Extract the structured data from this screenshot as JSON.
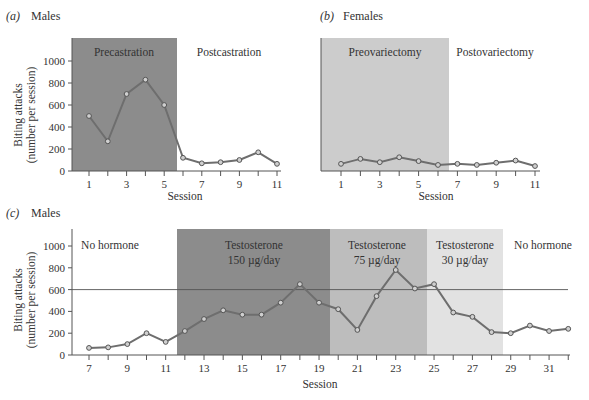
{
  "chart_data": [
    {
      "type": "line",
      "panel": "(a)",
      "title": "Males",
      "xlabel": "Session",
      "ylabel": "Biting attacks (number per session)",
      "ylim": [
        0,
        1100
      ],
      "yticks": [
        0,
        200,
        400,
        600,
        800,
        1000
      ],
      "xticks_labeled": [
        1,
        3,
        5,
        7,
        9,
        11
      ],
      "x": [
        1,
        2,
        3,
        4,
        5,
        6,
        7,
        8,
        9,
        10,
        11
      ],
      "values": [
        500,
        270,
        700,
        830,
        600,
        120,
        70,
        80,
        100,
        170,
        65
      ],
      "regions": [
        {
          "label": "Precastration",
          "from": 0.2,
          "to": 5.6,
          "shade": "#8c8c8c"
        },
        {
          "label": "Postcastration",
          "from": 5.6,
          "to": 11,
          "shade": "#ffffff"
        }
      ],
      "grid": false
    },
    {
      "type": "line",
      "panel": "(b)",
      "title": "Females",
      "xlabel": "Session",
      "ylabel": "",
      "ylim": [
        0,
        1100
      ],
      "xticks_labeled": [
        1,
        3,
        5,
        7,
        9,
        11
      ],
      "x": [
        1,
        2,
        3,
        4,
        5,
        6,
        7,
        8,
        9,
        10,
        11
      ],
      "values": [
        65,
        110,
        80,
        125,
        90,
        55,
        65,
        55,
        75,
        95,
        45
      ],
      "regions": [
        {
          "label": "Preovariectomy",
          "from": 0,
          "to": 6.5,
          "shade": "#cccccc"
        },
        {
          "label": "Postovariectomy",
          "from": 6.5,
          "to": 11,
          "shade": "#ffffff"
        }
      ],
      "grid": false
    },
    {
      "type": "line",
      "panel": "(c)",
      "title": "Males",
      "xlabel": "Session",
      "ylabel": "Biting attacks (number per session)",
      "ylim": [
        0,
        1100
      ],
      "yticks": [
        0,
        200,
        400,
        600,
        800,
        1000
      ],
      "xticks_labeled": [
        7,
        9,
        11,
        13,
        15,
        17,
        19,
        21,
        23,
        25,
        27,
        29,
        31
      ],
      "x": [
        7,
        8,
        9,
        10,
        11,
        12,
        13,
        14,
        15,
        16,
        17,
        18,
        19,
        20,
        21,
        22,
        23,
        24,
        25,
        26,
        27,
        28,
        29,
        30,
        31,
        32
      ],
      "values": [
        65,
        70,
        100,
        200,
        120,
        220,
        330,
        410,
        370,
        370,
        480,
        650,
        480,
        420,
        230,
        540,
        780,
        610,
        650,
        390,
        350,
        210,
        200,
        270,
        220,
        240
      ],
      "reference_line": 600,
      "regions": [
        {
          "label": "No hormone",
          "sub": "",
          "from": 6.1,
          "to": 11.6,
          "shade": "#ffffff"
        },
        {
          "label": "Testosterone",
          "sub": "150 µg/day",
          "from": 11.6,
          "to": 19.5,
          "shade": "#8c8c8c"
        },
        {
          "label": "Testosterone",
          "sub": "75 µg/day",
          "from": 19.5,
          "to": 24.5,
          "shade": "#bdbdbd"
        },
        {
          "label": "Testosterone",
          "sub": "30 µg/day",
          "from": 24.5,
          "to": 28.6,
          "shade": "#e2e2e2"
        },
        {
          "label": "No hormone",
          "sub": "",
          "from": 28.6,
          "to": 32,
          "shade": "#ffffff"
        }
      ],
      "grid": false
    }
  ],
  "panels": {
    "a": {
      "letter": "(a)",
      "title": "Males",
      "xlabel": "Session",
      "ylabel1": "Biting attacks",
      "ylabel2": "(number per session)"
    },
    "b": {
      "letter": "(b)",
      "title": "Females",
      "xlabel": "Session"
    },
    "c": {
      "letter": "(c)",
      "title": "Males",
      "xlabel": "Session",
      "ylabel1": "Biting attacks",
      "ylabel2": "(number per session)"
    }
  },
  "colors": {
    "line": "#6e6e6e",
    "marker": "#555555",
    "axis": "#555555"
  }
}
